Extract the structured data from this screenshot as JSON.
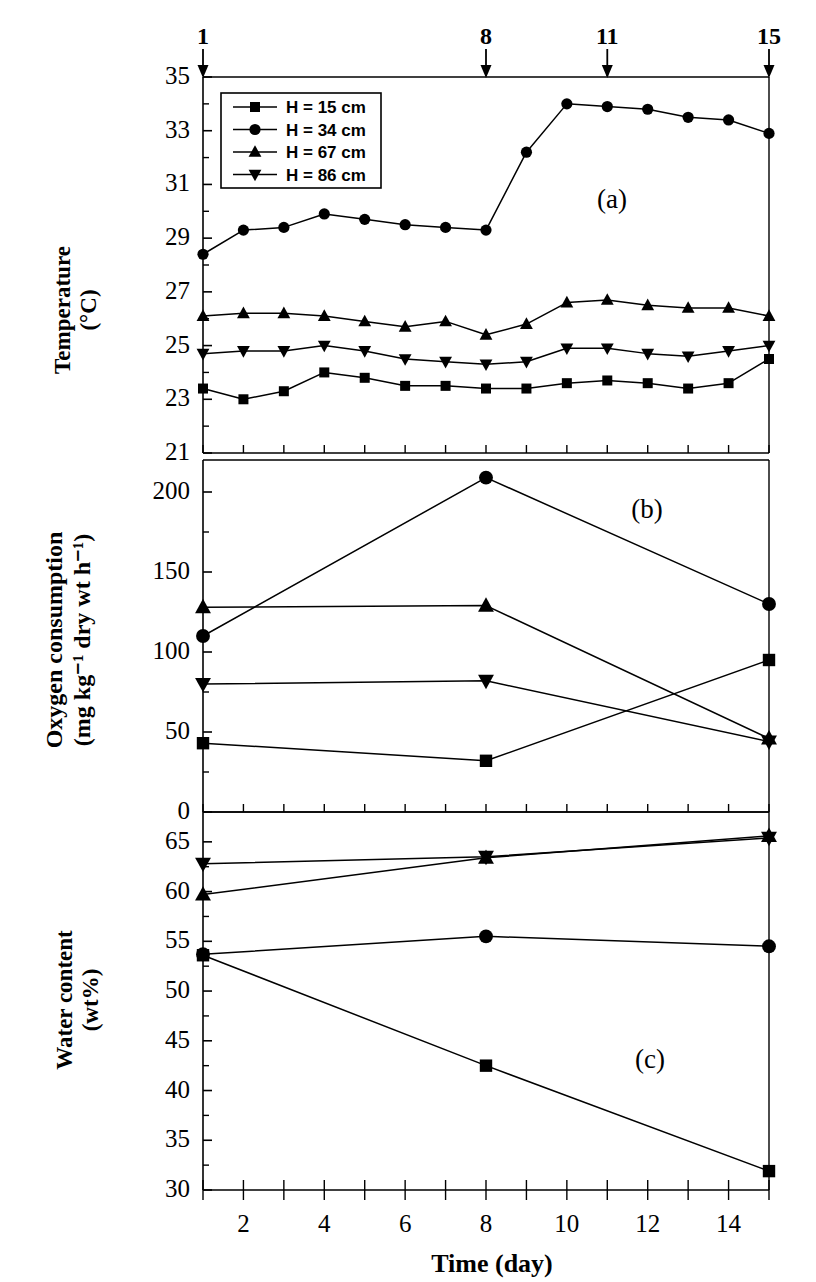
{
  "figure": {
    "panel_labels": {
      "a": "(a)",
      "b": "(b)",
      "c": "(c)"
    },
    "xaxis_title": "Time  (day)",
    "top_axis_markers": [
      "1",
      "8",
      "11",
      "15"
    ]
  },
  "legend": {
    "entries": [
      {
        "label": "H = 15 cm",
        "marker": "square"
      },
      {
        "label": "H = 34 cm",
        "marker": "circle"
      },
      {
        "label": "H = 67 cm",
        "marker": "triangle-up"
      },
      {
        "label": "H = 86 cm",
        "marker": "triangle-down"
      }
    ]
  },
  "chart_data": [
    {
      "type": "line",
      "panel": "(a)",
      "title": "",
      "xlabel": "Time  (day)",
      "ylabel": "Temperature (°C)",
      "ylabel_line1": "Temperature",
      "ylabel_line2": "(°C)",
      "xlim": [
        1,
        15
      ],
      "ylim": [
        21,
        35
      ],
      "xticks": [
        1,
        2,
        3,
        4,
        5,
        6,
        7,
        8,
        9,
        10,
        11,
        12,
        13,
        14,
        15
      ],
      "xticklabels": [
        "",
        "2",
        "",
        "4",
        "",
        "6",
        "",
        "8",
        "",
        "10",
        "",
        "12",
        "",
        "14",
        ""
      ],
      "yticks": [
        21,
        23,
        25,
        27,
        29,
        31,
        33,
        35
      ],
      "yticklabels": [
        "21",
        "23",
        "25",
        "27",
        "29",
        "31",
        "33",
        "35"
      ],
      "grid": false,
      "legend_position": "upper-left",
      "x": [
        1,
        2,
        3,
        4,
        5,
        6,
        7,
        8,
        9,
        10,
        11,
        12,
        13,
        14,
        15
      ],
      "series": [
        {
          "name": "H = 15 cm",
          "marker": "square",
          "values": [
            23.4,
            23.0,
            23.3,
            24.0,
            23.8,
            23.5,
            23.5,
            23.4,
            23.4,
            23.6,
            23.7,
            23.6,
            23.4,
            23.6,
            24.5
          ]
        },
        {
          "name": "H = 34 cm",
          "marker": "circle",
          "values": [
            28.4,
            29.3,
            29.4,
            29.9,
            29.7,
            29.5,
            29.4,
            29.3,
            32.2,
            34.0,
            33.9,
            33.8,
            33.5,
            33.4,
            32.9
          ]
        },
        {
          "name": "H = 67 cm",
          "marker": "triangle-up",
          "values": [
            26.1,
            26.2,
            26.2,
            26.1,
            25.9,
            25.7,
            25.9,
            25.4,
            25.8,
            26.6,
            26.7,
            26.5,
            26.4,
            26.4,
            26.1
          ]
        },
        {
          "name": "H = 86 cm",
          "marker": "triangle-down",
          "values": [
            24.7,
            24.8,
            24.8,
            25.0,
            24.8,
            24.5,
            24.4,
            24.3,
            24.4,
            24.9,
            24.9,
            24.7,
            24.6,
            24.8,
            25.0
          ]
        }
      ]
    },
    {
      "type": "line",
      "panel": "(b)",
      "title": "",
      "xlabel": "Time  (day)",
      "ylabel": "Oxygen consumption (mg kg⁻¹ dry wt h⁻¹)",
      "ylabel_line1": "Oxygen consumption",
      "ylabel_line2": "(mg kg⁻¹ dry wt h⁻¹)",
      "xlim": [
        1,
        15
      ],
      "ylim": [
        0,
        220
      ],
      "xticks": [
        1,
        2,
        3,
        4,
        5,
        6,
        7,
        8,
        9,
        10,
        11,
        12,
        13,
        14,
        15
      ],
      "yticks": [
        0,
        50,
        100,
        150,
        200
      ],
      "yticklabels": [
        "0",
        "50",
        "100",
        "150",
        "200"
      ],
      "grid": false,
      "x": [
        1,
        8,
        15
      ],
      "series": [
        {
          "name": "H = 15 cm",
          "marker": "square",
          "values": [
            43,
            32,
            95
          ]
        },
        {
          "name": "H = 34 cm",
          "marker": "circle",
          "values": [
            110,
            209,
            130
          ]
        },
        {
          "name": "H = 67 cm",
          "marker": "triangle-up",
          "values": [
            128,
            129,
            46
          ]
        },
        {
          "name": "H = 86 cm",
          "marker": "triangle-down",
          "values": [
            80,
            82,
            44
          ]
        }
      ]
    },
    {
      "type": "line",
      "panel": "(c)",
      "title": "",
      "xlabel": "Time  (day)",
      "ylabel": "Water content (wt%)",
      "ylabel_line1": "Water content",
      "ylabel_line2": "(wt%)",
      "xlim": [
        1,
        15
      ],
      "ylim": [
        30,
        68
      ],
      "xticks": [
        1,
        2,
        3,
        4,
        5,
        6,
        7,
        8,
        9,
        10,
        11,
        12,
        13,
        14,
        15
      ],
      "yticks": [
        30,
        35,
        40,
        45,
        50,
        55,
        60,
        65
      ],
      "yticklabels": [
        "30",
        "35",
        "40",
        "45",
        "50",
        "55",
        "60",
        "65"
      ],
      "grid": false,
      "x": [
        1,
        8,
        15
      ],
      "series": [
        {
          "name": "H = 15 cm",
          "marker": "square",
          "values": [
            53.6,
            42.5,
            31.9
          ]
        },
        {
          "name": "H = 34 cm",
          "marker": "circle",
          "values": [
            53.7,
            55.5,
            54.5
          ]
        },
        {
          "name": "H = 67 cm",
          "marker": "triangle-up",
          "values": [
            59.7,
            63.4,
            65.6
          ]
        },
        {
          "name": "H = 86 cm",
          "marker": "triangle-down",
          "values": [
            62.8,
            63.5,
            65.4
          ]
        }
      ]
    }
  ]
}
